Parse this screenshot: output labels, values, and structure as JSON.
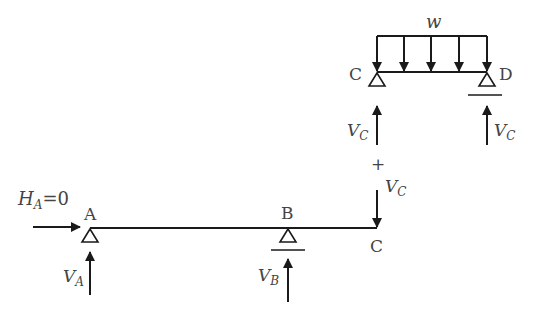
{
  "diagram": {
    "load_label": "w",
    "top_beam": {
      "left_node": "C",
      "right_node": "D"
    },
    "top_reactions": {
      "left": {
        "main": "V",
        "sub": "C"
      },
      "right": {
        "main": "V",
        "sub": "C"
      }
    },
    "plus_sign": "+",
    "transfer_force": {
      "main": "V",
      "sub": "C"
    },
    "bottom_beam": {
      "node_a": "A",
      "node_b": "B",
      "node_c": "C"
    },
    "horizontal_reaction": {
      "main": "H",
      "sub": "A",
      "value": "=0"
    },
    "bottom_reactions": {
      "a": {
        "main": "V",
        "sub": "A"
      },
      "b": {
        "main": "V",
        "sub": "B"
      }
    },
    "colors": {
      "line": "#1a1a1a",
      "text": "#444444"
    }
  }
}
